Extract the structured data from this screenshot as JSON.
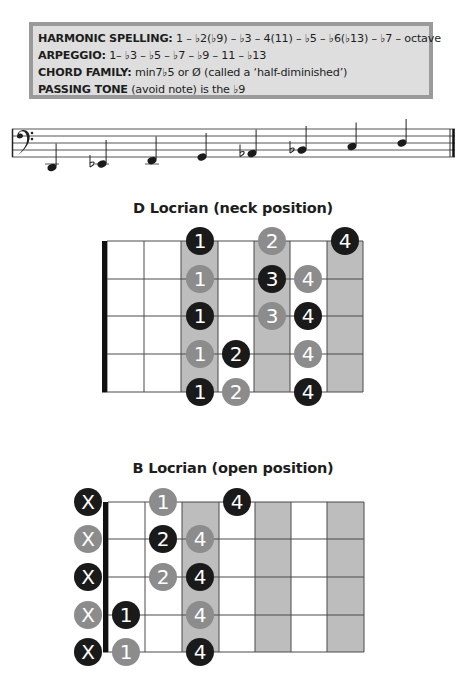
{
  "info_box": {
    "lines": [
      {
        "label": "HARMONIC SPELLING:",
        "text": " 1 – ♭2(♭9) – ♭3 – 4(11) – ♭5 – ♭6(♭13) – ♭7 – octave"
      },
      {
        "label": "ARPEGGIO:",
        "text": " 1– ♭3 – ♭5 – ♭7 – ♭9 – 11 – ♭13"
      },
      {
        "label": "CHORD FAMILY:",
        "text": " min7♭5 or Ø (called a ‘half-diminished’)"
      },
      {
        "label": "PASSING TONE",
        "text": " (avoid note) is the ♭9"
      }
    ]
  },
  "staff": {
    "clef": "bass-clef",
    "notes": [
      {
        "name": "D",
        "accidental": "",
        "x": 52,
        "y": 52.5
      },
      {
        "name": "Eb",
        "accidental": "flat",
        "x": 102,
        "y": 49
      },
      {
        "name": "F",
        "accidental": "",
        "x": 152,
        "y": 45.5
      },
      {
        "name": "G",
        "accidental": "",
        "x": 202,
        "y": 42
      },
      {
        "name": "Ab",
        "accidental": "flat",
        "x": 252,
        "y": 38.5
      },
      {
        "name": "Bb",
        "accidental": "flat",
        "x": 302,
        "y": 35
      },
      {
        "name": "C",
        "accidental": "",
        "x": 352,
        "y": 31.5
      },
      {
        "name": "D",
        "accidental": "",
        "x": 402,
        "y": 28
      }
    ]
  },
  "diagrams": [
    {
      "title": "D Locrian (neck position)",
      "top": 241,
      "nut_x": 102,
      "frets_x": [
        107,
        144,
        181,
        218,
        254,
        290,
        327,
        363
      ],
      "shaded_cells": [
        2,
        4,
        6
      ],
      "strings_y": [
        0,
        38,
        75,
        113,
        151
      ],
      "dots": [
        {
          "row": 0,
          "cx": 200,
          "finger": "1",
          "color": "black"
        },
        {
          "row": 0,
          "cx": 272,
          "finger": "2",
          "color": "gray"
        },
        {
          "row": 0,
          "cx": 345,
          "finger": "4",
          "color": "black"
        },
        {
          "row": 1,
          "cx": 200,
          "finger": "1",
          "color": "gray"
        },
        {
          "row": 1,
          "cx": 272,
          "finger": "3",
          "color": "black"
        },
        {
          "row": 1,
          "cx": 308,
          "finger": "4",
          "color": "gray"
        },
        {
          "row": 2,
          "cx": 200,
          "finger": "1",
          "color": "black"
        },
        {
          "row": 2,
          "cx": 272,
          "finger": "3",
          "color": "gray"
        },
        {
          "row": 2,
          "cx": 308,
          "finger": "4",
          "color": "black"
        },
        {
          "row": 3,
          "cx": 200,
          "finger": "1",
          "color": "gray"
        },
        {
          "row": 3,
          "cx": 236,
          "finger": "2",
          "color": "black"
        },
        {
          "row": 3,
          "cx": 308,
          "finger": "4",
          "color": "gray"
        },
        {
          "row": 4,
          "cx": 200,
          "finger": "1",
          "color": "black"
        },
        {
          "row": 4,
          "cx": 236,
          "finger": "2",
          "color": "gray"
        },
        {
          "row": 4,
          "cx": 308,
          "finger": "4",
          "color": "black"
        }
      ],
      "muted": []
    },
    {
      "title": "B Locrian (open position)",
      "top": 502,
      "nut_x": 103,
      "frets_x": [
        108,
        145,
        182,
        219,
        255,
        291,
        327,
        364
      ],
      "shaded_cells": [
        2,
        4,
        6
      ],
      "strings_y": [
        0,
        37,
        75,
        113,
        150
      ],
      "dots": [
        {
          "row": 0,
          "cx": 163,
          "finger": "1",
          "color": "gray"
        },
        {
          "row": 0,
          "cx": 237,
          "finger": "4",
          "color": "black"
        },
        {
          "row": 1,
          "cx": 163,
          "finger": "2",
          "color": "black"
        },
        {
          "row": 1,
          "cx": 200,
          "finger": "4",
          "color": "gray"
        },
        {
          "row": 2,
          "cx": 163,
          "finger": "2",
          "color": "gray"
        },
        {
          "row": 2,
          "cx": 200,
          "finger": "4",
          "color": "black"
        },
        {
          "row": 3,
          "cx": 126,
          "finger": "1",
          "color": "black"
        },
        {
          "row": 3,
          "cx": 200,
          "finger": "4",
          "color": "gray"
        },
        {
          "row": 4,
          "cx": 126,
          "finger": "1",
          "color": "gray"
        },
        {
          "row": 4,
          "cx": 200,
          "finger": "4",
          "color": "black"
        }
      ],
      "muted": [
        {
          "row": 0,
          "label": "X",
          "color": "black"
        },
        {
          "row": 1,
          "label": "X",
          "color": "gray"
        },
        {
          "row": 2,
          "label": "X",
          "color": "black"
        },
        {
          "row": 3,
          "label": "X",
          "color": "gray"
        },
        {
          "row": 4,
          "label": "X",
          "color": "black"
        }
      ]
    }
  ],
  "colors": {
    "black_dot": "#1a1a1a",
    "gray_dot": "#8c8c8c",
    "shade": "#bdbdbd",
    "line": "#4a4a4a",
    "box_bg": "#dedede",
    "box_border": "#9a9a9a"
  }
}
